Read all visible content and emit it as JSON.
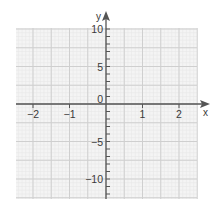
{
  "chart_data": {
    "type": "line",
    "title": "",
    "xlabel": "x",
    "ylabel": "y",
    "xlim": [
      -2.47,
      2.5
    ],
    "ylim": [
      -12.67,
      10.13
    ],
    "grid": true,
    "legend": null,
    "x_ticks": [
      -2,
      -1,
      0,
      1,
      2
    ],
    "x_tick_labels": [
      "−2",
      "−1",
      "0",
      "1",
      "2"
    ],
    "y_ticks": [
      -10,
      -5,
      0,
      5,
      10
    ],
    "y_tick_labels": [
      "−10",
      "−5",
      "0",
      "5",
      "10"
    ],
    "x_major_grid_step": 0.5,
    "y_major_grid_step": 2.5,
    "y_minor_tick_step": 1,
    "series": []
  },
  "colors": {
    "background": "#f4f4f4",
    "major_grid": "#cfcfcf",
    "minor_grid": "#e7e7e7",
    "axis": "#555555",
    "text": "#3a3a3a"
  }
}
